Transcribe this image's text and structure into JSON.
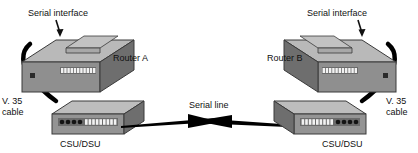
{
  "diagram": {
    "background": "#ffffff",
    "colors": {
      "device_top": "#b4b4b4",
      "device_front": "#8f8f8f",
      "device_side": "#6e6e6e",
      "device_outline": "#3a3a3a",
      "port_light": "#f2f2f2",
      "port_dark": "#1a1a1a",
      "cable": "#000000",
      "line": "#000000",
      "text": "#111111"
    },
    "labels": {
      "serial_interface_left": "Serial interface",
      "serial_interface_right": "Serial interface",
      "router_a": "Router A",
      "router_b": "Router B",
      "v35_cable_left_line1": "V. 35",
      "v35_cable_left_line2": "cable",
      "v35_cable_right_line1": "V. 35",
      "v35_cable_right_line2": "cable",
      "csu_dsu_left": "CSU/DSU",
      "csu_dsu_right": "CSU/DSU",
      "serial_line": "Serial line"
    },
    "nodes": [
      {
        "id": "router-a",
        "label": "Router A",
        "type": "router",
        "side": "left"
      },
      {
        "id": "router-b",
        "label": "Router B",
        "type": "router",
        "side": "right"
      },
      {
        "id": "csu-dsu-left",
        "label": "CSU/DSU",
        "type": "csu-dsu",
        "side": "left"
      },
      {
        "id": "csu-dsu-right",
        "label": "CSU/DSU",
        "type": "csu-dsu",
        "side": "right"
      }
    ],
    "links": [
      {
        "id": "v35-left",
        "label": "V. 35 cable",
        "from": "router-a",
        "to": "csu-dsu-left",
        "style": "thick-curve"
      },
      {
        "id": "v35-right",
        "label": "V. 35 cable",
        "from": "router-b",
        "to": "csu-dsu-right",
        "style": "thick-curve"
      },
      {
        "id": "serial-line",
        "label": "Serial line",
        "from": "csu-dsu-left",
        "to": "csu-dsu-right",
        "style": "bowtie-arrow"
      }
    ],
    "annotations": [
      {
        "id": "ann-serial-left",
        "label": "Serial interface",
        "points_to": "router-a",
        "arrow": "down"
      },
      {
        "id": "ann-serial-right",
        "label": "Serial interface",
        "points_to": "router-b",
        "arrow": "down"
      }
    ],
    "ports": {
      "router_port_count": 11,
      "csu_dsu_light_port_count": 9,
      "csu_dsu_round_port_count": 4
    }
  }
}
